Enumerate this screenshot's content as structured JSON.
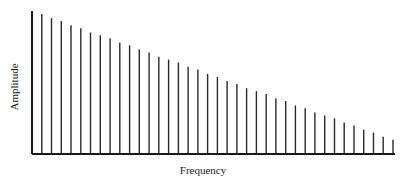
{
  "chart_data": {
    "type": "bar",
    "subtype": "line-spectrum",
    "title": "",
    "xlabel": "Frequency",
    "ylabel": "Amplitude",
    "x_ticks": [],
    "y_ticks": [],
    "grid": false,
    "legend": null,
    "ylim": [
      0,
      1
    ],
    "x": [
      1,
      2,
      3,
      4,
      5,
      6,
      7,
      8,
      9,
      10,
      11,
      12,
      13,
      14,
      15,
      16,
      17,
      18,
      19,
      20,
      21,
      22,
      23,
      24,
      25,
      26,
      27,
      28,
      29,
      30,
      31,
      32,
      33,
      34,
      35,
      36,
      37,
      38
    ],
    "values": [
      1.0,
      0.98,
      0.95,
      0.93,
      0.9,
      0.88,
      0.85,
      0.83,
      0.81,
      0.78,
      0.76,
      0.73,
      0.71,
      0.68,
      0.66,
      0.64,
      0.61,
      0.59,
      0.56,
      0.54,
      0.51,
      0.49,
      0.46,
      0.44,
      0.42,
      0.39,
      0.37,
      0.34,
      0.32,
      0.29,
      0.27,
      0.25,
      0.22,
      0.2,
      0.17,
      0.15,
      0.12,
      0.1
    ],
    "note": "Relative amplitudes of harmonics decreasing linearly with frequency; no numeric axis labels shown"
  }
}
